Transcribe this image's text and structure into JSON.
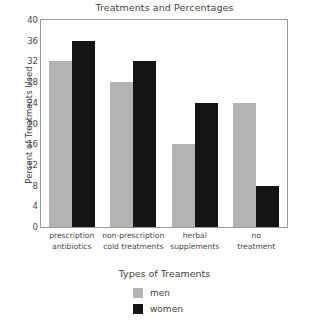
{
  "chart_data": {
    "type": "bar",
    "title": "Treatments and Percentages",
    "xlabel": "Types of Treaments",
    "ylabel": "Percent of Treatments Used",
    "categories": [
      "prescription antibiotics",
      "non-prescription cold treatments",
      "herbal supplements",
      "no treatment"
    ],
    "category_lines": [
      [
        "prescription",
        "antibiotics"
      ],
      [
        "non-prescription",
        "cold treatments"
      ],
      [
        "herbal",
        "supplements"
      ],
      [
        "no",
        "treatment"
      ]
    ],
    "series": [
      {
        "name": "men",
        "color": "#b3b3b3",
        "values": [
          32,
          28,
          16,
          24
        ]
      },
      {
        "name": "women",
        "color": "#141414",
        "values": [
          36,
          32,
          24,
          8
        ]
      }
    ],
    "ylim": [
      0,
      40
    ],
    "yticks": [
      40,
      36,
      32,
      28,
      24,
      20,
      16,
      12,
      8,
      4,
      0
    ],
    "ytick_labels": [
      "40",
      "36",
      "32",
      "28",
      "24",
      "20",
      "16",
      "12",
      "8",
      "4",
      "0"
    ],
    "grid": false,
    "legend_position": "bottom"
  },
  "legend": {
    "entries": [
      {
        "label": "men",
        "color": "#b3b3b3"
      },
      {
        "label": "women",
        "color": "#141414"
      }
    ]
  }
}
